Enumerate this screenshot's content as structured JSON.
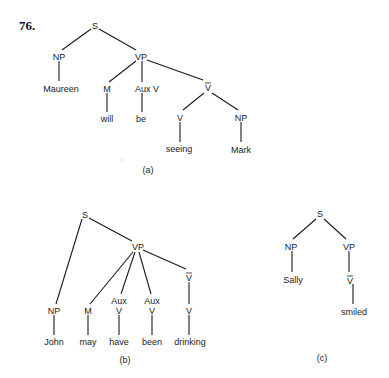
{
  "figure_number": "76.",
  "trees": [
    {
      "caption": "(a)",
      "nodes": {
        "s": "S",
        "np": "NP",
        "vp": "VP",
        "maureen": "Maureen",
        "m": "M",
        "auxv": "Aux V",
        "will": "will",
        "be": "be",
        "vbar": "V",
        "v": "V",
        "np2": "NP",
        "seeing": "seeing",
        "mark": "Mark"
      }
    },
    {
      "caption": "(b)",
      "nodes": {
        "s": "S",
        "vp": "VP",
        "np": "NP",
        "john": "John",
        "m": "M",
        "may": "may",
        "aux1": "Aux",
        "v1": "V",
        "have": "have",
        "aux2": "Aux",
        "v2": "V",
        "been": "been",
        "vbar": "V",
        "v3": "V",
        "drinking": "drinking"
      }
    },
    {
      "caption": "(c)",
      "nodes": {
        "s": "S",
        "np": "NP",
        "vp": "VP",
        "sally": "Sally",
        "vbar": "V",
        "smiled": "smiled"
      }
    }
  ],
  "colors": {
    "ink": "#1a1a1a",
    "background": "#ffffff"
  }
}
